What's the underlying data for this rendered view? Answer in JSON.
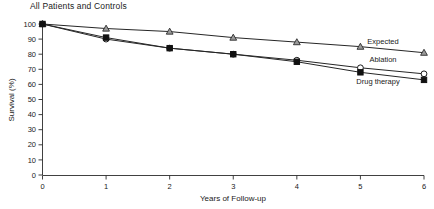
{
  "chart_data": {
    "type": "line",
    "title": "All Patients and Controls",
    "xlabel": "Years of Follow-up",
    "ylabel": "Survival (%)",
    "x": [
      0,
      1,
      2,
      3,
      4,
      5,
      6
    ],
    "xlim": [
      0,
      6
    ],
    "ylim": [
      0,
      100
    ],
    "xticks": [
      "0",
      "1",
      "2",
      "3",
      "4",
      "5",
      "6"
    ],
    "yticks": [
      "0",
      "10",
      "20",
      "30",
      "40",
      "50",
      "60",
      "70",
      "80",
      "90",
      "100"
    ],
    "grid": false,
    "legend_position": "inline-right",
    "series": [
      {
        "name": "Expected",
        "marker": "triangle",
        "values": [
          100,
          97,
          95,
          91,
          88,
          85,
          81
        ]
      },
      {
        "name": "Ablation",
        "marker": "open-circle",
        "values": [
          100,
          90,
          84,
          80,
          76,
          71,
          67
        ]
      },
      {
        "name": "Drug therapy",
        "marker": "filled-square",
        "values": [
          100,
          91,
          84,
          80,
          75,
          68,
          63
        ]
      }
    ]
  },
  "labels": {
    "expected": "Expected",
    "ablation": "Ablation",
    "drug_therapy": "Drug therapy"
  }
}
